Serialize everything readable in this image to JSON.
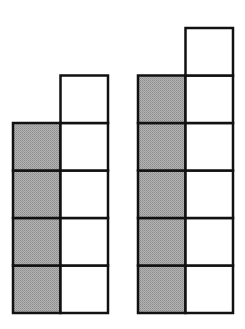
{
  "diagram": {
    "cell_size": 47.5,
    "colors": {
      "shaded": "#a6a6a6",
      "unshaded": "#ffffff",
      "stroke": "#111111"
    },
    "figures": [
      {
        "name": "left-figure",
        "x": 13,
        "bottom": 313,
        "shaded_cells": 4,
        "white_cells": 5
      },
      {
        "name": "right-figure",
        "x": 138,
        "bottom": 313,
        "shaded_cells": 5,
        "white_cells": 6
      }
    ]
  }
}
